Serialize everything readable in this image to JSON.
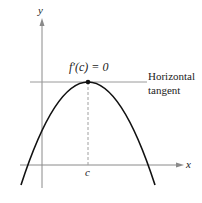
{
  "diagram": {
    "axes": {
      "x_label": "x",
      "y_label": "y"
    },
    "point_label": "f′(c) = 0",
    "tick_label": "c",
    "tangent_label_line1": "Horizontal",
    "tangent_label_line2": "tangent",
    "colors": {
      "curve": "#111111",
      "axis": "#8a8a8a",
      "tangent": "#9a9a9a",
      "dashed": "#a0a0a0"
    }
  }
}
